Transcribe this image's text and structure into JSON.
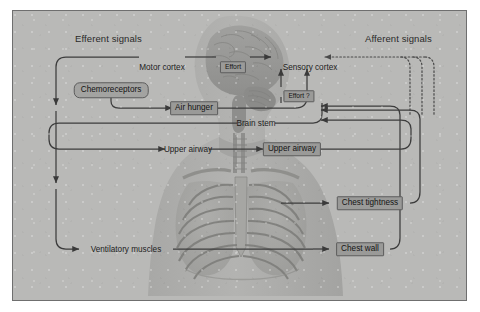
{
  "figure": {
    "frame_border_color": "#6f6f6f",
    "background_color": "#b9b9b7",
    "label_box_fill": "#9a9a98"
  },
  "headers": {
    "efferent": "Efferent signals",
    "afferent": "Afferent signals"
  },
  "nodes": {
    "motor_cortex": "Motor cortex",
    "effort": "Effort",
    "sensory_cortex": "Sensory cortex",
    "chemoreceptors": "Chemoreceptors",
    "air_hunger": "Air hunger",
    "effort_query": "Effort ?",
    "brain_stem": "Brain stem",
    "upper_airway_left": "Upper airway",
    "upper_airway_right": "Upper airway",
    "chest_tightness": "Chest tightness",
    "ventilatory_muscles": "Ventilatory muscles",
    "chest_wall": "Chest wall"
  },
  "legend": {
    "solid_meaning": "Efferent (motor) pathway",
    "dotted_meaning": "Afferent (sensory) pathway"
  }
}
